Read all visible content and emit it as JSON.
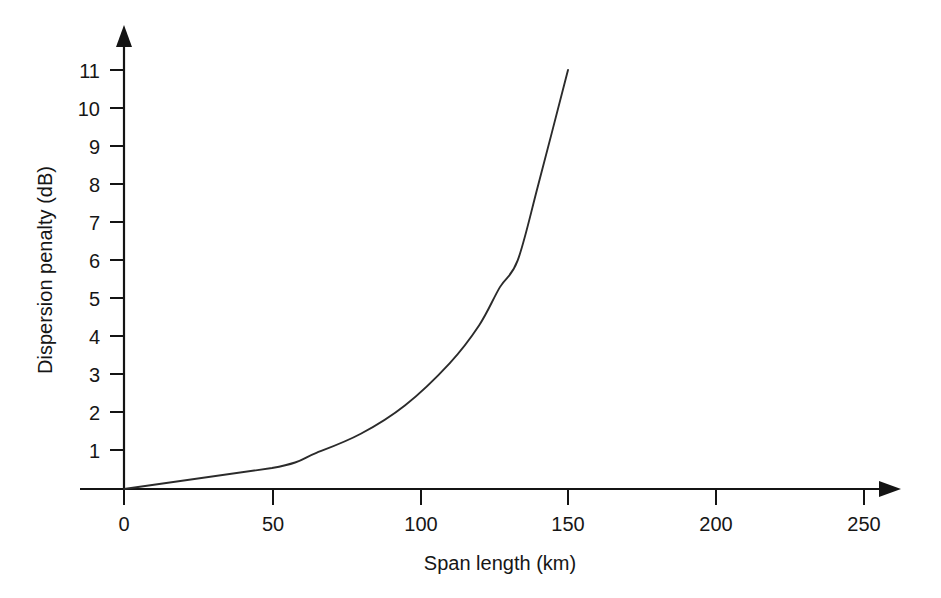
{
  "chart_data": {
    "type": "line",
    "title": "",
    "subtitle": "",
    "xlabel": "Span length (km)",
    "ylabel": "Dispersion penalty (dB)",
    "xlim": [
      0,
      265
    ],
    "ylim": [
      0,
      11.6
    ],
    "xticks": [
      0,
      50,
      100,
      150,
      200,
      250
    ],
    "xtick_labels": [
      "0",
      "50",
      "100",
      "150",
      "200",
      "250"
    ],
    "yticks": [
      1,
      2,
      3,
      4,
      5,
      6,
      7,
      8,
      9,
      10,
      11
    ],
    "ytick_labels": [
      "1",
      "2",
      "3",
      "4",
      "5",
      "6",
      "7",
      "8",
      "9",
      "10",
      "11"
    ],
    "grid": false,
    "legend": null,
    "annotations": [],
    "series": [
      {
        "name": "Dispersion penalty vs span length",
        "color": "#2b2b2b",
        "x": [
          0,
          50,
          65,
          80,
          95,
          110,
          120,
          127,
          133,
          140,
          150
        ],
        "values": [
          0,
          0.55,
          0.95,
          1.45,
          2.2,
          3.3,
          4.3,
          5.3,
          6.0,
          8.0,
          11.0
        ]
      }
    ]
  },
  "axes": {
    "x_axis_name": "span-length-axis",
    "y_axis_name": "dispersion-penalty-axis",
    "x_arrow": "arrow-right",
    "y_arrow": "arrow-up"
  },
  "colors": {
    "background": "#ffffff",
    "axis": "#141414",
    "curve": "#2b2b2b",
    "text": "#161616"
  }
}
